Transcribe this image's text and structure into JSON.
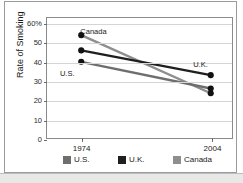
{
  "chart_data": {
    "type": "line",
    "title": "",
    "xlabel": "",
    "ylabel": "Rate of Smoking",
    "x": [
      "1974",
      "2004"
    ],
    "xtick_labels": [
      "1974",
      "2004"
    ],
    "ytick_labels": [
      "60%",
      "50",
      "40",
      "30",
      "20",
      "10",
      "0"
    ],
    "ytick_values": [
      60,
      50,
      40,
      30,
      20,
      10,
      0
    ],
    "ylim": [
      0,
      63
    ],
    "grid": true,
    "legend_position": "bottom",
    "markers": "filled-circle",
    "series": [
      {
        "name": "U.S.",
        "color": "#6e6e6e",
        "values": [
          40,
          26
        ],
        "label_text": "U.S.",
        "label_x_pct": 7,
        "label_y_pct": 43
      },
      {
        "name": "U.K.",
        "color": "#1f1f1f",
        "values": [
          46,
          33
        ],
        "label_text": "U.K.",
        "label_x_pct": 79,
        "label_y_pct": 36
      },
      {
        "name": "Canada",
        "color": "#8e8e8e",
        "values": [
          54,
          23.5
        ],
        "label_text": "Canada",
        "label_x_pct": 18,
        "label_y_pct": 8
      }
    ],
    "legend": [
      {
        "label": "U.S.",
        "color": "#6e6e6e"
      },
      {
        "label": "U.K.",
        "color": "#1f1f1f"
      },
      {
        "label": "Canada",
        "color": "#8e8e8e"
      }
    ]
  },
  "colors": {
    "frame": "#9b9b9b",
    "plot_border": "#8a8a8a",
    "gridline": "#d5d5d5",
    "text": "#1a1a1a",
    "background": "#ffffff",
    "bottom_band": "#e8e8e8"
  }
}
